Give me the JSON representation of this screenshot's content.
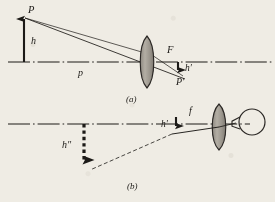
{
  "figure": {
    "background_color": "#efece4",
    "ink_color": "#1c1a17",
    "lens_fill_color": "#9a958c",
    "panels": [
      {
        "id": "a",
        "caption": "(a)",
        "labels": {
          "object_point": "P",
          "object_height": "h",
          "object_distance": "p",
          "focal_point": "F",
          "image_height": "h′",
          "image_point": "P′"
        }
      },
      {
        "id": "b",
        "caption": "(b)",
        "labels": {
          "focal_length": "f",
          "image_height": "h′",
          "virtual_image_height": "h″"
        }
      }
    ],
    "elements": {
      "axis_style": "dash-dot",
      "object_arrow": "solid-up-arrow",
      "image_arrow": "solid-down-arrow",
      "virtual_image_arrow": "thick-dashed-down-arrow",
      "lens_shape": "biconvex",
      "eye_shape": "circle-with-cornea"
    }
  }
}
